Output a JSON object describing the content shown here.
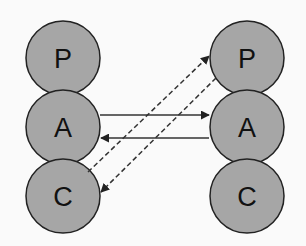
{
  "diagram": {
    "colors": {
      "node_fill": "#a6a6a6",
      "node_stroke": "#222222",
      "edge": "#333333",
      "background": "#fafafa"
    },
    "left_column": {
      "nodes": [
        {
          "id": "left-p",
          "label": "P",
          "cx": 63,
          "cy": 58
        },
        {
          "id": "left-a",
          "label": "A",
          "cx": 63,
          "cy": 127
        },
        {
          "id": "left-c",
          "label": "C",
          "cx": 63,
          "cy": 196
        }
      ]
    },
    "right_column": {
      "nodes": [
        {
          "id": "right-p",
          "label": "P",
          "cx": 247,
          "cy": 58
        },
        {
          "id": "right-a",
          "label": "A",
          "cx": 247,
          "cy": 127
        },
        {
          "id": "right-c",
          "label": "C",
          "cx": 247,
          "cy": 196
        }
      ]
    },
    "edges": [
      {
        "from": "left-a",
        "to": "right-a",
        "style": "solid"
      },
      {
        "from": "right-a",
        "to": "left-a",
        "style": "solid"
      },
      {
        "from": "left-c",
        "to": "right-p",
        "style": "dashed"
      },
      {
        "from": "right-p",
        "to": "left-c",
        "style": "dashed"
      }
    ]
  }
}
